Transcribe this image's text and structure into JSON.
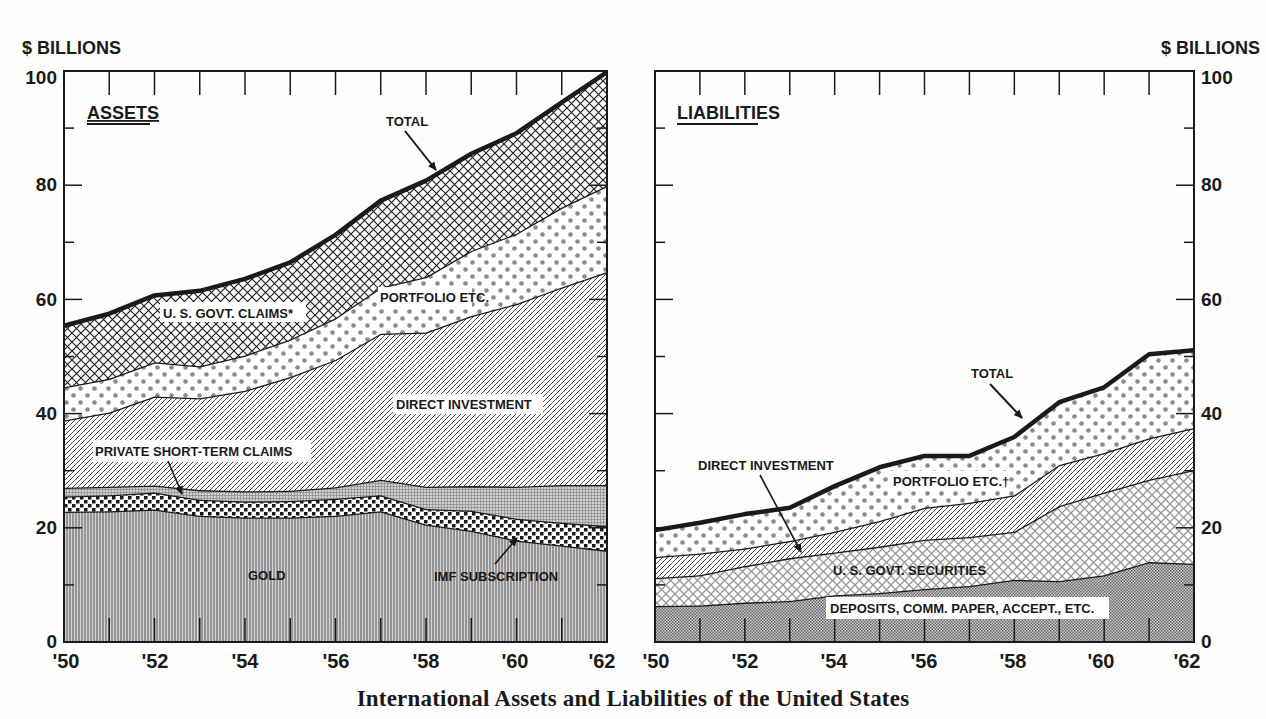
{
  "caption": "International Assets and Liabilities of the United States",
  "colors": {
    "ink": "#1a1a1a",
    "paper": "#fdfdfc",
    "gray_fill": "#bdbdbd",
    "dot": "#8a8a8a"
  },
  "chart_data": [
    {
      "type": "area",
      "stacked": true,
      "title": "ASSETS",
      "ylabel": "$ BILLIONS",
      "xlabel": "",
      "y_axis_side": "left",
      "ylim": [
        0,
        100
      ],
      "yticks": [
        0,
        20,
        40,
        60,
        80,
        100
      ],
      "x": [
        1950,
        1951,
        1952,
        1953,
        1954,
        1955,
        1956,
        1957,
        1958,
        1959,
        1960,
        1961,
        1962
      ],
      "xtick_labels": [
        "'50",
        "'52",
        "'54",
        "'56",
        "'58",
        "'60",
        "'62"
      ],
      "grid": false,
      "legend": "inline labels",
      "series": [
        {
          "name": "GOLD",
          "pattern": "vertical-lines",
          "values": [
            22.8,
            22.9,
            23.2,
            22.1,
            21.8,
            21.8,
            22.1,
            22.9,
            20.6,
            19.5,
            17.8,
            16.9,
            16.0
          ]
        },
        {
          "name": "IMF SUBSCRIPTION",
          "pattern": "checker-dots",
          "values": [
            2.7,
            2.8,
            3.0,
            2.8,
            2.8,
            2.9,
            3.0,
            2.8,
            2.7,
            3.5,
            3.8,
            4.0,
            4.3
          ]
        },
        {
          "name": "PRIVATE SHORT-TERM CLAIMS",
          "pattern": "fine-grid",
          "values": [
            1.5,
            1.5,
            1.2,
            1.7,
            1.8,
            1.8,
            2.0,
            2.7,
            3.9,
            4.3,
            5.6,
            6.6,
            7.2
          ]
        },
        {
          "name": "DIRECT INVESTMENT",
          "pattern": "diagonal-lines",
          "values": [
            11.8,
            13.0,
            15.6,
            16.1,
            17.6,
            19.9,
            22.3,
            25.6,
            27.0,
            29.8,
            32.0,
            34.6,
            37.3
          ]
        },
        {
          "name": "PORTFOLIO ETC.",
          "pattern": "dots",
          "values": [
            5.8,
            5.9,
            6.0,
            5.6,
            6.2,
            6.6,
            7.3,
            8.1,
            9.7,
            11.4,
            12.3,
            14.0,
            15.1
          ]
        },
        {
          "name": "U. S. GOVT. CLAIMS*",
          "pattern": "cross-hatch",
          "values": [
            10.8,
            11.4,
            11.7,
            13.2,
            13.4,
            13.5,
            14.6,
            15.2,
            16.9,
            17.0,
            17.6,
            18.4,
            19.9
          ]
        }
      ],
      "totals": [
        55.4,
        57.5,
        60.4,
        61.5,
        64.0,
        66.7,
        71.3,
        77.4,
        80.7,
        85.2,
        89.7,
        94.8,
        99.8
      ],
      "annotations": [
        "TOTAL"
      ]
    },
    {
      "type": "area",
      "stacked": true,
      "title": "LIABILITIES",
      "ylabel": "$ BILLIONS",
      "xlabel": "",
      "y_axis_side": "right",
      "ylim": [
        0,
        100
      ],
      "yticks": [
        0,
        20,
        40,
        60,
        80,
        100
      ],
      "x": [
        1950,
        1951,
        1952,
        1953,
        1954,
        1955,
        1956,
        1957,
        1958,
        1959,
        1960,
        1961,
        1962
      ],
      "xtick_labels": [
        "'50",
        "'52",
        "'54",
        "'56",
        "'58",
        "'60",
        "'62"
      ],
      "grid": false,
      "legend": "inline labels",
      "series": [
        {
          "name": "DEPOSITS, COMM. PAPER, ACCEPT., ETC.",
          "pattern": "fine-checker",
          "values": [
            6.3,
            6.4,
            6.9,
            7.2,
            8.2,
            8.6,
            9.3,
            9.8,
            10.9,
            10.7,
            11.7,
            14.0,
            13.7
          ]
        },
        {
          "name": "U. S. GOVT. SECURITIES",
          "pattern": "cross-hatch-light",
          "values": [
            4.9,
            5.3,
            6.4,
            7.5,
            7.5,
            8.1,
            8.6,
            8.6,
            8.4,
            13.1,
            14.5,
            14.4,
            16.4
          ]
        },
        {
          "name": "DIRECT INVESTMENT",
          "pattern": "diagonal-lines",
          "values": [
            3.7,
            3.8,
            3.1,
            3.0,
            3.6,
            4.5,
            5.6,
            6.0,
            6.4,
            7.2,
            6.9,
            7.3,
            7.4
          ]
        },
        {
          "name": "PORTFOLIO ETC.†",
          "pattern": "dots",
          "values": [
            4.7,
            5.4,
            6.0,
            5.8,
            8.0,
            9.4,
            9.1,
            8.2,
            10.2,
            11.0,
            11.5,
            14.7,
            13.6
          ]
        }
      ],
      "totals": [
        19.6,
        20.9,
        22.4,
        23.5,
        27.3,
        30.6,
        32.6,
        32.6,
        35.9,
        42.0,
        44.6,
        50.4,
        51.1
      ],
      "annotations": [
        "TOTAL"
      ]
    }
  ],
  "left_panel": {
    "unit_label": "$ BILLIONS",
    "title": "ASSETS",
    "ytick_labels": [
      "0",
      "20",
      "40",
      "60",
      "80",
      "100"
    ],
    "xtick_labels": [
      "'50",
      "'52",
      "'54",
      "'56",
      "'58",
      "'60",
      "'62"
    ],
    "labels": {
      "total": "TOTAL",
      "govt": "U. S. GOVT. CLAIMS*",
      "portfolio": "PORTFOLIO ETC.",
      "direct": "DIRECT INVESTMENT",
      "private": "PRIVATE SHORT-TERM CLAIMS",
      "gold": "GOLD",
      "imf": "IMF SUBSCRIPTION"
    }
  },
  "right_panel": {
    "unit_label": "$ BILLIONS",
    "title": "LIABILITIES",
    "ytick_labels": [
      "0",
      "20",
      "40",
      "60",
      "80",
      "100"
    ],
    "xtick_labels": [
      "'50",
      "'52",
      "'54",
      "'56",
      "'58",
      "'60",
      "'62"
    ],
    "labels": {
      "total": "TOTAL",
      "direct": "DIRECT INVESTMENT",
      "portfolio": "PORTFOLIO ETC.†",
      "govt_sec": "U. S. GOVT. SECURITIES",
      "deposits": "DEPOSITS, COMM. PAPER, ACCEPT., ETC."
    }
  }
}
